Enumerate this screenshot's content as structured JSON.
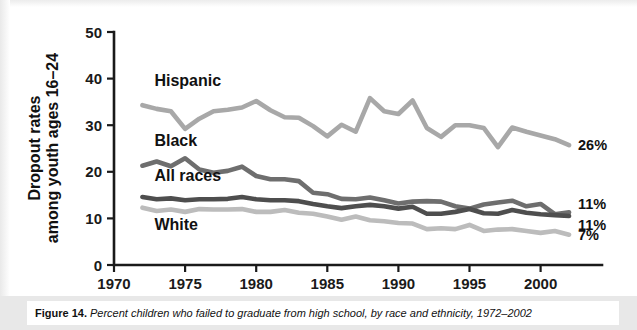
{
  "figure": {
    "caption_number": "Figure 14.",
    "caption_text": "Percent children who failed to graduate from high school, by race and ethnicity, 1972–2002"
  },
  "chart_data": {
    "type": "line",
    "title": "",
    "xlabel": "",
    "ylabel": "Dropout rates among youth ages 16–24",
    "ylabel_line1": "Dropout rates",
    "ylabel_line2": "among youth ages 16–24",
    "xlim": [
      1970,
      2003
    ],
    "ylim": [
      0,
      50
    ],
    "xticks": [
      1970,
      1975,
      1980,
      1985,
      1990,
      1995,
      2000
    ],
    "yticks": [
      0,
      10,
      20,
      30,
      40,
      50
    ],
    "grid": false,
    "legend": "inline-labels",
    "x": [
      1972,
      1973,
      1974,
      1975,
      1976,
      1977,
      1978,
      1979,
      1980,
      1981,
      1982,
      1983,
      1984,
      1985,
      1986,
      1987,
      1988,
      1989,
      1990,
      1991,
      1992,
      1993,
      1994,
      1995,
      1996,
      1997,
      1998,
      1999,
      2000,
      2001,
      2002
    ],
    "series": [
      {
        "name": "Hispanic",
        "color": "#a8a8a8",
        "end_label": "26%",
        "values": [
          34.3,
          33.5,
          33.0,
          29.2,
          31.4,
          33.0,
          33.3,
          33.8,
          35.2,
          33.2,
          31.7,
          31.6,
          29.8,
          27.6,
          30.1,
          28.6,
          35.8,
          33.0,
          32.4,
          35.3,
          29.4,
          27.5,
          30.0,
          30.0,
          29.4,
          25.3,
          29.5,
          28.6,
          27.8,
          27.0,
          25.7
        ]
      },
      {
        "name": "Black",
        "color": "#6e6e6e",
        "end_label": "11%",
        "values": [
          21.3,
          22.2,
          21.2,
          22.9,
          20.5,
          19.8,
          20.2,
          21.1,
          19.1,
          18.4,
          18.4,
          18.0,
          15.5,
          15.2,
          14.2,
          14.1,
          14.5,
          13.9,
          13.2,
          13.6,
          13.7,
          13.6,
          12.6,
          12.1,
          13.0,
          13.4,
          13.8,
          12.6,
          13.1,
          10.9,
          11.3
        ]
      },
      {
        "name": "All races",
        "color": "#4e4e4e",
        "end_label": "11%",
        "values": [
          14.6,
          14.1,
          14.3,
          13.9,
          14.1,
          14.1,
          14.2,
          14.6,
          14.1,
          13.9,
          13.9,
          13.7,
          13.1,
          12.6,
          12.2,
          12.6,
          12.9,
          12.6,
          12.1,
          12.5,
          11.0,
          11.0,
          11.4,
          12.0,
          11.1,
          11.0,
          11.8,
          11.2,
          10.9,
          10.7,
          10.5
        ]
      },
      {
        "name": "White",
        "color": "#bcbcbc",
        "end_label": "7%",
        "values": [
          12.3,
          11.6,
          11.9,
          11.4,
          12.0,
          11.9,
          11.9,
          12.0,
          11.4,
          11.4,
          11.8,
          11.2,
          11.0,
          10.4,
          9.7,
          10.4,
          9.6,
          9.4,
          9.0,
          8.9,
          7.7,
          7.9,
          7.7,
          8.6,
          7.3,
          7.6,
          7.7,
          7.3,
          6.9,
          7.3,
          6.5
        ]
      }
    ],
    "inline_labels": [
      {
        "text": "Hispanic",
        "x": 1972,
        "y": 38.5
      },
      {
        "text": "Black",
        "x": 1972,
        "y": 25.5
      },
      {
        "text": "All races",
        "x": 1972,
        "y": 18.0
      },
      {
        "text": "White",
        "x": 1972,
        "y": 7.6
      }
    ]
  }
}
